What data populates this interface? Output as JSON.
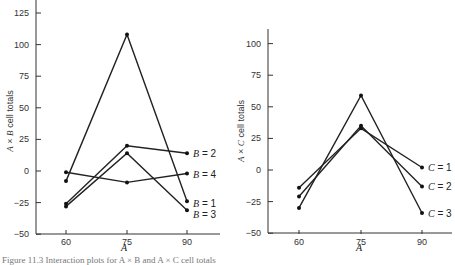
{
  "chart_data": [
    {
      "type": "line",
      "title": "",
      "xlabel": "A",
      "ylabel": "A × B cell totals",
      "x": [
        60,
        75,
        90
      ],
      "xticks": [
        "60",
        "75",
        "90"
      ],
      "yticks": [
        "125",
        "100",
        "75",
        "50",
        "25",
        "0",
        "-25",
        "-50"
      ],
      "ylim": [
        -50,
        130
      ],
      "grid": false,
      "legend_position": "inline-right",
      "series": [
        {
          "name": "B = 1",
          "values": [
            -8,
            108,
            -24
          ]
        },
        {
          "name": "B = 2",
          "values": [
            -26,
            20,
            14
          ]
        },
        {
          "name": "B = 3",
          "values": [
            -28,
            14,
            -31
          ]
        },
        {
          "name": "B = 4",
          "values": [
            -1,
            -9,
            -2
          ]
        }
      ]
    },
    {
      "type": "line",
      "title": "",
      "xlabel": "A",
      "ylabel": "A × C cell totals",
      "x": [
        60,
        75,
        90
      ],
      "xticks": [
        "60",
        "75",
        "90"
      ],
      "yticks": [
        "100",
        "75",
        "50",
        "25",
        "0",
        "-25",
        "-50"
      ],
      "ylim": [
        -50,
        112
      ],
      "grid": false,
      "legend_position": "inline-right",
      "series": [
        {
          "name": "C = 1",
          "values": [
            -14,
            33,
            2
          ]
        },
        {
          "name": "C = 2",
          "values": [
            -21,
            35,
            -13
          ]
        },
        {
          "name": "C = 3",
          "values": [
            -30,
            59,
            -34
          ]
        }
      ]
    }
  ],
  "labels": {
    "left_ylabel_prefix": "A",
    "left_ylabel_times": " × ",
    "left_ylabel_factor": "B",
    "left_ylabel_suffix": " cell totals",
    "right_ylabel_prefix": "A",
    "right_ylabel_times": " × ",
    "right_ylabel_factor": "C",
    "right_ylabel_suffix": " cell totals",
    "left_xlabel": "A",
    "right_xlabel": "A",
    "caption": "Figure 11.3  Interaction plots for A × B and A × C cell totals"
  }
}
